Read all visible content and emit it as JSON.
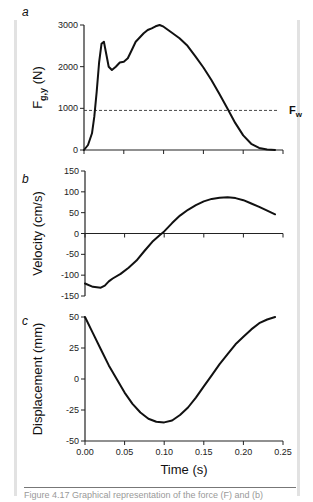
{
  "figure": {
    "caption": "Figure 4.17 Graphical representation of the force (F) and (b)"
  },
  "chart_data": [
    {
      "type": "line",
      "panel": "a",
      "title": "",
      "xlabel": "",
      "ylabel": "F_g,y (N)",
      "ylabel_main": "F",
      "ylabel_sub": "g,y",
      "ylabel_unit": " (N)",
      "xlim": [
        0,
        0.25
      ],
      "ylim": [
        0,
        3000
      ],
      "xticks": [
        0,
        0.05,
        0.1,
        0.15,
        0.2,
        0.25
      ],
      "yticks": [
        0,
        1000,
        2000,
        3000
      ],
      "ytick_labels": [
        "0",
        "1000",
        "2000",
        "3000"
      ],
      "reference_line": {
        "label_main": "F",
        "label_sub": "w",
        "value": 950,
        "style": "dashed"
      },
      "series": [
        {
          "name": "F_g,y",
          "x": [
            0,
            0.005,
            0.01,
            0.013,
            0.016,
            0.019,
            0.022,
            0.025,
            0.028,
            0.031,
            0.035,
            0.04,
            0.045,
            0.05,
            0.055,
            0.06,
            0.065,
            0.07,
            0.075,
            0.08,
            0.085,
            0.09,
            0.095,
            0.1,
            0.11,
            0.12,
            0.13,
            0.14,
            0.15,
            0.16,
            0.17,
            0.18,
            0.19,
            0.2,
            0.21,
            0.22,
            0.23,
            0.24
          ],
          "y": [
            0,
            120,
            400,
            800,
            1400,
            2100,
            2550,
            2600,
            2300,
            2000,
            1920,
            2000,
            2100,
            2120,
            2200,
            2400,
            2600,
            2700,
            2800,
            2880,
            2920,
            2970,
            3000,
            2960,
            2820,
            2680,
            2500,
            2250,
            1980,
            1680,
            1350,
            1000,
            650,
            350,
            150,
            50,
            15,
            0
          ]
        }
      ]
    },
    {
      "type": "line",
      "panel": "b",
      "title": "",
      "xlabel": "",
      "ylabel": "Velocity (cm/s)",
      "xlim": [
        0,
        0.25
      ],
      "ylim": [
        -150,
        150
      ],
      "xticks": [
        0,
        0.05,
        0.1,
        0.15,
        0.2,
        0.25
      ],
      "yticks": [
        -150,
        -100,
        -50,
        0,
        50,
        100,
        150
      ],
      "ytick_labels": [
        "-150",
        "-100",
        "-50",
        "0",
        "50",
        "100",
        "150"
      ],
      "series": [
        {
          "name": "Velocity",
          "x": [
            0,
            0.01,
            0.02,
            0.025,
            0.03,
            0.035,
            0.045,
            0.055,
            0.065,
            0.075,
            0.085,
            0.095,
            0.1,
            0.11,
            0.12,
            0.13,
            0.14,
            0.15,
            0.16,
            0.17,
            0.18,
            0.19,
            0.2,
            0.21,
            0.22,
            0.23,
            0.24
          ],
          "y": [
            -120,
            -128,
            -130,
            -125,
            -115,
            -108,
            -97,
            -82,
            -65,
            -42,
            -20,
            -3,
            5,
            25,
            43,
            57,
            68,
            77,
            83,
            86,
            87,
            85,
            80,
            72,
            64,
            55,
            46
          ]
        }
      ]
    },
    {
      "type": "line",
      "panel": "c",
      "title": "",
      "xlabel": "Time (s)",
      "ylabel": "Displacement (mm)",
      "xlim": [
        0,
        0.25
      ],
      "ylim": [
        -50,
        50
      ],
      "xticks": [
        0,
        0.05,
        0.1,
        0.15,
        0.2,
        0.25
      ],
      "xtick_labels": [
        "0.00",
        "0.05",
        "0.10",
        "0.15",
        "0.20",
        "0.25"
      ],
      "yticks": [
        -50,
        -25,
        0,
        25,
        50
      ],
      "ytick_labels": [
        "-50",
        "-25",
        "0",
        "25",
        "50"
      ],
      "series": [
        {
          "name": "Displacement",
          "x": [
            0,
            0.01,
            0.02,
            0.03,
            0.04,
            0.05,
            0.06,
            0.07,
            0.08,
            0.09,
            0.1,
            0.11,
            0.12,
            0.13,
            0.14,
            0.15,
            0.16,
            0.17,
            0.18,
            0.19,
            0.2,
            0.21,
            0.22,
            0.23,
            0.24
          ],
          "y": [
            50,
            37,
            24,
            11,
            0,
            -11,
            -20,
            -27,
            -32,
            -34.5,
            -35,
            -33.5,
            -29,
            -23,
            -15,
            -6,
            3,
            12,
            20,
            28,
            34,
            40,
            45,
            48,
            50
          ]
        }
      ]
    }
  ]
}
